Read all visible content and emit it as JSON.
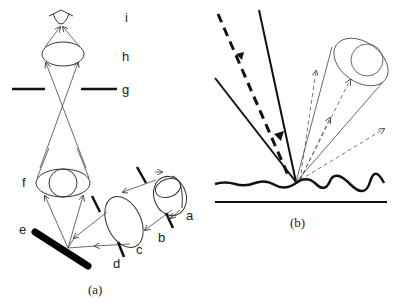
{
  "panel_a": {
    "caption": "(a)",
    "labels": {
      "a": "a",
      "b": "b",
      "c": "c",
      "d": "d",
      "e": "e",
      "f": "f",
      "g": "g",
      "h": "h",
      "i": "i"
    }
  },
  "panel_b": {
    "caption": "(b)"
  },
  "colors": {
    "ink": "#111111",
    "background": "#ffffff"
  }
}
